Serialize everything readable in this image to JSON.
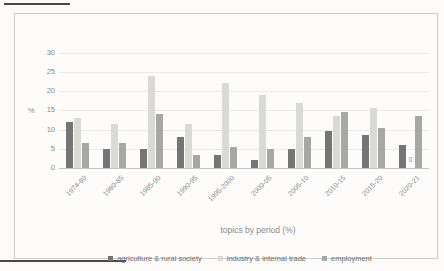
{
  "chart_data": {
    "type": "bar",
    "title": "",
    "xlabel": "topics by period (%)",
    "ylabel": "%",
    "ylim": [
      0,
      30
    ],
    "yticks": [
      0,
      5,
      10,
      15,
      20,
      25,
      30
    ],
    "grid": true,
    "legend_position": "bottom",
    "categories": [
      "1974-80",
      "1980-85",
      "1985-90",
      "1990-95",
      "1995-2000",
      "2000-05",
      "2005-10",
      "2010-15",
      "2015-20",
      "2020-21"
    ],
    "series": [
      {
        "name": "agriculture & rural society",
        "color": "#757575",
        "values": [
          12,
          5,
          5,
          8,
          3.5,
          2,
          5,
          9.5,
          8.5,
          6
        ]
      },
      {
        "name": "industry & internal trade",
        "color": "#d9d9d6",
        "values": [
          13,
          11.5,
          24,
          11.5,
          22,
          19,
          17,
          13.5,
          15.5,
          0
        ]
      },
      {
        "name": "employment",
        "color": "#a7a7a4",
        "values": [
          6.5,
          6.5,
          14,
          3.5,
          5.5,
          5,
          8,
          14.5,
          10.5,
          13.5
        ]
      }
    ],
    "data_labels": [
      {
        "series_index": 1,
        "category_index": 9,
        "text": "0"
      }
    ]
  },
  "theme": {
    "background": "#fcfbf9",
    "frame_border": "#cfcdc9",
    "gridline": "#eceae7",
    "axis_line": "#c8c6c3",
    "tick_text": "#8a8a8a",
    "legend_text": "#6e6e6e"
  }
}
